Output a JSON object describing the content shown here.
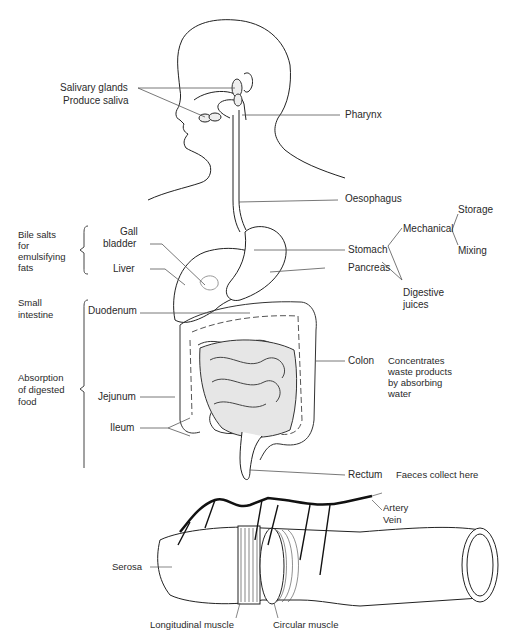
{
  "diagram": {
    "type": "digestive-system",
    "labels": {
      "salivary_glands": "Salivary glands",
      "produce_saliva": "Produce saliva",
      "pharynx": "Pharynx",
      "oesophagus": "Oesophagus",
      "bile_salts": [
        "Bile salts",
        "for",
        "emulsifying",
        "fats"
      ],
      "gall_bladder": [
        "Gall",
        "bladder"
      ],
      "liver": "Liver",
      "stomach": "Stomach",
      "pancreas": "Pancreas",
      "mechanical": "Mechanical",
      "storage": "Storage",
      "mixing": "Mixing",
      "digestive_juices": [
        "Digestive",
        "juices"
      ],
      "small_intestine": [
        "Small",
        "intestine"
      ],
      "duodenum": "Duodenum",
      "absorption": [
        "Absorption",
        "of digested",
        "food"
      ],
      "jejunum": "Jejunum",
      "ileum": "Ileum",
      "colon": "Colon",
      "colon_note": [
        "Concentrates",
        "waste products",
        "by absorbing",
        "water"
      ],
      "rectum": "Rectum",
      "rectum_note": "Faeces collect here"
    },
    "cross_section": {
      "artery": "Artery",
      "vein": "Vein",
      "serosa": "Serosa",
      "longitudinal_muscle": "Longitudinal muscle",
      "circular_muscle": "Circular muscle"
    },
    "colors": {
      "line": "#222222",
      "intestine_fill": "#e6e6e6",
      "background": "#ffffff"
    }
  }
}
